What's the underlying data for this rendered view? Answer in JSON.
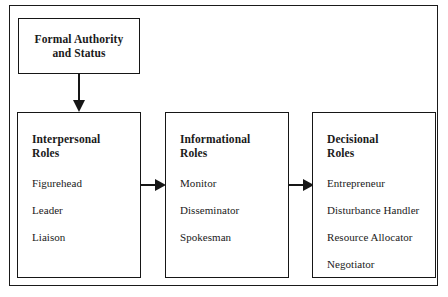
{
  "diagram": {
    "title_box": {
      "label": "Formal Authority\nand Status"
    },
    "groups": [
      {
        "heading": "Interpersonal\nRoles",
        "items": [
          "Figurehead",
          "Leader",
          "Liaison"
        ]
      },
      {
        "heading": "Informational\nRoles",
        "items": [
          "Monitor",
          "Disseminator",
          "Spokesman"
        ]
      },
      {
        "heading": "Decisional\nRoles",
        "items": [
          "Entrepreneur",
          "Disturbance Handler",
          "Resource Allocator",
          "Negotiator"
        ]
      }
    ],
    "connectors": {
      "vertical_arrow": "arrow-down",
      "horizontal_arrow_1": "arrow-right",
      "horizontal_arrow_2": "arrow-right"
    },
    "colors": {
      "background": "#ffffff",
      "line": "#161616",
      "text": "#1a1a1a"
    }
  }
}
